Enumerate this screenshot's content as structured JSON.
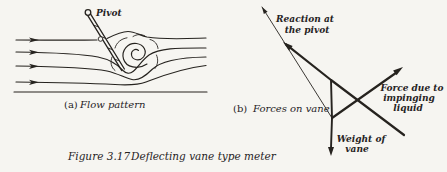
{
  "colors": {
    "ink": "#26231f",
    "paper": "#f6f5f1"
  },
  "caption": {
    "number": "Figure 3.17",
    "title": "Deflecting vane type meter"
  },
  "panel_a": {
    "index": "(a)",
    "title": "Flow pattern",
    "pivot_label": "Pivot"
  },
  "panel_b": {
    "index": "(b)",
    "title": "Forces on vane",
    "reaction_label": [
      "Reaction at",
      "the pivot"
    ],
    "force_label": [
      "Force due to",
      "impinging",
      "liquid"
    ],
    "weight_label": [
      "Weight of",
      "vane"
    ]
  }
}
